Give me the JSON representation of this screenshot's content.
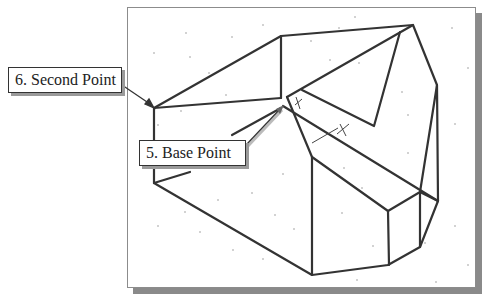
{
  "figure": {
    "callouts": [
      {
        "id": "second-point",
        "label": "6. Second Point"
      },
      {
        "id": "base-point",
        "label": "5. Base Point"
      }
    ],
    "colors": {
      "line": "#333333",
      "frame": "#8c8c8c",
      "shadow": "#8a8a8a",
      "background": "#ffffff"
    }
  }
}
